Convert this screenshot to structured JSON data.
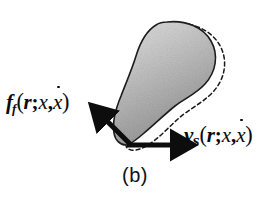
{
  "figure": {
    "caption": "(b)",
    "background_color": "#ffffff",
    "labels": {
      "friction_force": {
        "symbol": "f",
        "subscript": "f",
        "open_paren": "(",
        "arg1": "r",
        "sep1": ";",
        "arg2": "x",
        "sep2": ",",
        "arg3": "x",
        "arg3_accent": "dot",
        "close_paren": ")",
        "full_text": "f_f(r;x,ẋ)"
      },
      "slip_velocity": {
        "symbol": "v",
        "subscript": "S",
        "open_paren": "(",
        "arg1": "r",
        "sep1": ";",
        "arg2": "x",
        "sep2": ",",
        "arg3": "x",
        "arg3_accent": "dot",
        "close_paren": ")",
        "full_text": "v_S(r;x,ẋ)"
      }
    },
    "shape": {
      "name": "contact-patch-blob",
      "fill_light": "#d6d6d6",
      "fill_mid": "#b0b0b0",
      "fill_dark": "#8d8d8d",
      "stroke_color": "#1c1c1c",
      "texture": "grainy"
    },
    "dashed_outline": {
      "name": "deformed-outline",
      "stroke_color": "#1a1a1a",
      "dash_pattern": "4 3"
    },
    "arrows": {
      "friction_force_vector": {
        "color": "#0d0d0d",
        "direction": "up-left",
        "origin": [
          130,
          144
        ],
        "tip": [
          99,
          113
        ]
      },
      "slip_velocity_vector": {
        "color": "#0d0d0d",
        "direction": "right",
        "origin": [
          128,
          145
        ],
        "tip": [
          184,
          145
        ]
      }
    }
  }
}
